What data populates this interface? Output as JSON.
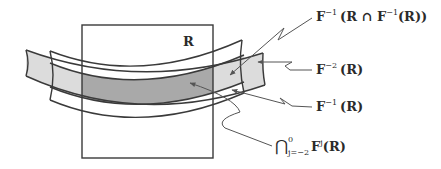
{
  "diagram": {
    "colors": {
      "stroke": "#3a3a3a",
      "light_fill": "#dcdcdc",
      "dark_fill": "#a9a9a9",
      "background": "#ffffff",
      "leader": "#555555"
    },
    "region_label": "R",
    "labels": {
      "f_inv_r_cap": {
        "base": "F",
        "sup": "−1",
        "rest": "(R ∩ F",
        "sup2": "−1",
        "rest2": "(R))"
      },
      "f_inv2": {
        "base": "F",
        "sup": "−2",
        "rest": "(R)"
      },
      "f_inv1": {
        "base": "F",
        "sup": "−1",
        "rest": "(R)"
      },
      "intersection": {
        "op": "⋂",
        "sup": "0",
        "sub": "j=−2",
        "base": "F",
        "sup2": "j",
        "rest": "(R)"
      }
    }
  }
}
